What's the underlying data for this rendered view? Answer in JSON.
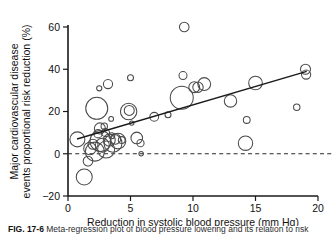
{
  "figure": {
    "caption_label": "FIG. 17-6",
    "caption_text": "Meta-regression plot of blood pressure lowering and its relation to risk"
  },
  "chart_data": {
    "type": "scatter",
    "title": "",
    "xlabel": "Reduction in systolic blood pressure (mm Hg)",
    "ylabel": "Major cardiovascular disease events proportional risk reduction (%)",
    "xlim": [
      0,
      20
    ],
    "ylim": [
      -20,
      60
    ],
    "xticks": [
      0,
      5,
      10,
      15,
      20
    ],
    "yticks": [
      -20,
      0,
      20,
      40,
      60
    ],
    "xtick_labels": [
      "0",
      "5",
      "10",
      "15",
      "20"
    ],
    "ytick_labels": [
      "−20",
      "0",
      "20",
      "40",
      "60"
    ],
    "grid": false,
    "legend": false,
    "reference_line": {
      "orientation": "horizontal",
      "value": 0,
      "style": "dashed",
      "color": "#2a2a2a"
    },
    "trend_line": {
      "x_start": 0.72,
      "y_start": 7.0,
      "x_end": 19.1,
      "y_end": 39.0,
      "color": "#1a1a1a"
    },
    "size_encoding": "bubble area proportional to trial weight / sample size",
    "points": [
      {
        "x": 0.75,
        "y": 6.8,
        "r": 7.5
      },
      {
        "x": 1.3,
        "y": -11.0,
        "r": 8.0
      },
      {
        "x": 1.6,
        "y": -3.5,
        "r": 4.8
      },
      {
        "x": 1.75,
        "y": 2.5,
        "r": 6.2
      },
      {
        "x": 2.0,
        "y": 4.5,
        "r": 5.0
      },
      {
        "x": 2.15,
        "y": 1.0,
        "r": 9.5
      },
      {
        "x": 2.3,
        "y": 21.5,
        "r": 11.0
      },
      {
        "x": 2.4,
        "y": 9.5,
        "r": 4.2
      },
      {
        "x": 2.5,
        "y": 31.0,
        "r": 2.6
      },
      {
        "x": 2.55,
        "y": 12.0,
        "r": 5.5
      },
      {
        "x": 2.6,
        "y": 6.0,
        "r": 10.5
      },
      {
        "x": 2.75,
        "y": 4.0,
        "r": 7.0
      },
      {
        "x": 2.9,
        "y": 13.0,
        "r": 3.2
      },
      {
        "x": 3.0,
        "y": 10.0,
        "r": 4.0
      },
      {
        "x": 3.05,
        "y": 2.0,
        "r": 8.5
      },
      {
        "x": 3.2,
        "y": 33.0,
        "r": 4.6
      },
      {
        "x": 3.3,
        "y": 6.5,
        "r": 6.0
      },
      {
        "x": 3.45,
        "y": 16.5,
        "r": 2.4
      },
      {
        "x": 3.5,
        "y": 8.5,
        "r": 3.0
      },
      {
        "x": 3.6,
        "y": 5.0,
        "r": 9.0
      },
      {
        "x": 3.8,
        "y": 7.0,
        "r": 5.2
      },
      {
        "x": 4.0,
        "y": 6.0,
        "r": 7.8
      },
      {
        "x": 4.3,
        "y": 6.5,
        "r": 3.4
      },
      {
        "x": 4.85,
        "y": 20.0,
        "r": 8.2
      },
      {
        "x": 4.9,
        "y": 20.5,
        "r": 5.0
      },
      {
        "x": 5.0,
        "y": 36.0,
        "r": 3.0
      },
      {
        "x": 5.1,
        "y": 14.5,
        "r": 2.2
      },
      {
        "x": 5.5,
        "y": 7.5,
        "r": 5.8
      },
      {
        "x": 5.8,
        "y": 5.0,
        "r": 3.6
      },
      {
        "x": 5.85,
        "y": 0.0,
        "r": 2.2
      },
      {
        "x": 6.9,
        "y": 17.5,
        "r": 4.4
      },
      {
        "x": 8.0,
        "y": 18.5,
        "r": 3.0
      },
      {
        "x": 9.3,
        "y": 60.0,
        "r": 4.8
      },
      {
        "x": 9.2,
        "y": 37.0,
        "r": 4.0
      },
      {
        "x": 9.1,
        "y": 26.5,
        "r": 11.5
      },
      {
        "x": 10.1,
        "y": 31.5,
        "r": 5.4
      },
      {
        "x": 10.4,
        "y": 31.5,
        "r": 5.2
      },
      {
        "x": 10.9,
        "y": 33.0,
        "r": 6.4
      },
      {
        "x": 13.0,
        "y": 25.0,
        "r": 6.2
      },
      {
        "x": 14.2,
        "y": 5.0,
        "r": 7.2
      },
      {
        "x": 14.3,
        "y": 16.0,
        "r": 3.4
      },
      {
        "x": 15.0,
        "y": 33.5,
        "r": 6.8
      },
      {
        "x": 18.3,
        "y": 22.0,
        "r": 3.2
      },
      {
        "x": 19.0,
        "y": 40.0,
        "r": 5.0
      },
      {
        "x": 19.05,
        "y": 37.5,
        "r": 4.6
      }
    ]
  }
}
